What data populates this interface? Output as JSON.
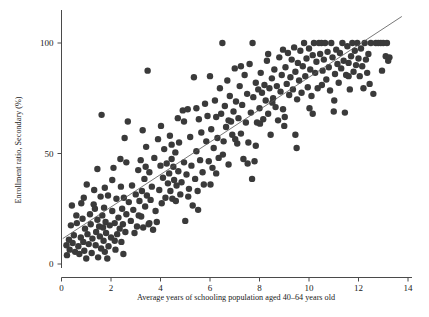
{
  "chart_data": {
    "type": "scatter",
    "title": "",
    "xlabel": "Average years of schooling population aged 40–64 years old",
    "ylabel": "Enrollment ratio, Secondary (%)",
    "xlim": [
      -0.4,
      14.6
    ],
    "ylim": [
      -6,
      116
    ],
    "xticks": [
      0,
      2,
      4,
      6,
      8,
      10,
      12,
      14
    ],
    "xticklabels": [
      "0",
      "2",
      "4",
      "6",
      "8",
      "10",
      "12",
      "14"
    ],
    "yticks": [
      0,
      50,
      100
    ],
    "yticklabels": [
      "0",
      "50",
      "100"
    ],
    "grid": false,
    "legend": null,
    "marker": {
      "shape": "circle",
      "size": 3.2,
      "color": "#3a3a3a"
    },
    "fit_line": {
      "type": "linear",
      "color": "#555555",
      "x_start": 0.05,
      "x_end": 13.75,
      "y_start": 11.5,
      "y_end": 112.0,
      "slope": 7.34,
      "intercept": 11.13
    },
    "points": [
      [
        0.2,
        8.5
      ],
      [
        0.22,
        4.0
      ],
      [
        0.3,
        11.0
      ],
      [
        0.33,
        6.5
      ],
      [
        0.38,
        17.5
      ],
      [
        0.42,
        26.5
      ],
      [
        0.45,
        9.5
      ],
      [
        0.5,
        13.0
      ],
      [
        0.55,
        5.5
      ],
      [
        0.6,
        22.0
      ],
      [
        0.62,
        18.5
      ],
      [
        0.68,
        8.0
      ],
      [
        0.72,
        4.5
      ],
      [
        0.78,
        12.0
      ],
      [
        0.8,
        27.5
      ],
      [
        0.85,
        20.5
      ],
      [
        0.88,
        10.0
      ],
      [
        0.92,
        6.0
      ],
      [
        0.95,
        16.0
      ],
      [
        1.0,
        2.5
      ],
      [
        1.02,
        36.0
      ],
      [
        1.05,
        13.5
      ],
      [
        1.1,
        9.0
      ],
      [
        1.15,
        22.5
      ],
      [
        1.18,
        18.0
      ],
      [
        1.22,
        5.0
      ],
      [
        1.25,
        11.5
      ],
      [
        1.3,
        27.0
      ],
      [
        1.32,
        33.5
      ],
      [
        1.38,
        8.5
      ],
      [
        1.4,
        14.5
      ],
      [
        1.45,
        20.0
      ],
      [
        1.48,
        3.0
      ],
      [
        1.52,
        17.0
      ],
      [
        1.55,
        12.5
      ],
      [
        1.58,
        30.5
      ],
      [
        1.6,
        7.0
      ],
      [
        1.62,
        67.5
      ],
      [
        1.65,
        22.0
      ],
      [
        1.68,
        16.5
      ],
      [
        1.7,
        10.5
      ],
      [
        1.72,
        25.5
      ],
      [
        1.75,
        5.5
      ],
      [
        1.78,
        19.0
      ],
      [
        1.8,
        14.0
      ],
      [
        1.85,
        2.5
      ],
      [
        1.88,
        31.0
      ],
      [
        1.9,
        8.0
      ],
      [
        1.95,
        17.5
      ],
      [
        2.0,
        12.0
      ],
      [
        2.05,
        24.0
      ],
      [
        2.1,
        43.5
      ],
      [
        2.15,
        18.5
      ],
      [
        2.18,
        6.5
      ],
      [
        2.22,
        29.5
      ],
      [
        2.25,
        13.5
      ],
      [
        2.3,
        21.0
      ],
      [
        2.35,
        16.0
      ],
      [
        2.38,
        47.5
      ],
      [
        2.4,
        35.0
      ],
      [
        2.42,
        10.0
      ],
      [
        2.45,
        25.0
      ],
      [
        2.48,
        18.0
      ],
      [
        2.5,
        4.5
      ],
      [
        2.52,
        30.0
      ],
      [
        2.55,
        57.0
      ],
      [
        2.58,
        14.5
      ],
      [
        2.62,
        22.5
      ],
      [
        2.68,
        64.5
      ],
      [
        2.72,
        28.0
      ],
      [
        2.8,
        19.5
      ],
      [
        2.85,
        35.5
      ],
      [
        2.9,
        24.5
      ],
      [
        3.0,
        31.5
      ],
      [
        3.05,
        17.0
      ],
      [
        3.1,
        42.5
      ],
      [
        3.15,
        28.5
      ],
      [
        3.2,
        47.0
      ],
      [
        3.22,
        21.5
      ],
      [
        3.25,
        33.0
      ],
      [
        3.28,
        60.5
      ],
      [
        3.3,
        16.5
      ],
      [
        3.35,
        38.5
      ],
      [
        3.38,
        26.0
      ],
      [
        3.4,
        44.0
      ],
      [
        3.45,
        31.0
      ],
      [
        3.48,
        87.5
      ],
      [
        3.52,
        18.0
      ],
      [
        3.55,
        41.5
      ],
      [
        3.6,
        29.0
      ],
      [
        3.65,
        35.0
      ],
      [
        3.7,
        15.5
      ],
      [
        3.75,
        48.0
      ],
      [
        3.8,
        24.0
      ],
      [
        3.85,
        19.0
      ],
      [
        3.9,
        56.5
      ],
      [
        3.95,
        33.5
      ],
      [
        4.0,
        44.5
      ],
      [
        4.05,
        27.5
      ],
      [
        4.1,
        39.0
      ],
      [
        4.15,
        52.0
      ],
      [
        4.2,
        30.0
      ],
      [
        4.25,
        45.5
      ],
      [
        4.3,
        36.5
      ],
      [
        4.35,
        41.0
      ],
      [
        4.38,
        58.0
      ],
      [
        4.4,
        33.0
      ],
      [
        4.45,
        47.5
      ],
      [
        4.48,
        29.5
      ],
      [
        4.52,
        44.0
      ],
      [
        4.55,
        38.0
      ],
      [
        4.6,
        50.5
      ],
      [
        4.65,
        35.5
      ],
      [
        4.7,
        66.0
      ],
      [
        4.72,
        42.0
      ],
      [
        4.75,
        55.0
      ],
      [
        4.8,
        31.5
      ],
      [
        4.85,
        37.0
      ],
      [
        4.9,
        69.5
      ],
      [
        4.95,
        46.0
      ],
      [
        5.0,
        19.5
      ],
      [
        5.05,
        40.5
      ],
      [
        5.1,
        70.0
      ],
      [
        5.15,
        34.0
      ],
      [
        5.2,
        57.5
      ],
      [
        5.25,
        44.5
      ],
      [
        5.3,
        26.5
      ],
      [
        5.35,
        84.5
      ],
      [
        5.4,
        38.5
      ],
      [
        5.45,
        51.0
      ],
      [
        5.5,
        33.0
      ],
      [
        5.55,
        65.5
      ],
      [
        5.6,
        47.0
      ],
      [
        5.65,
        59.5
      ],
      [
        5.7,
        41.5
      ],
      [
        5.75,
        36.0
      ],
      [
        5.8,
        72.5
      ],
      [
        5.85,
        55.5
      ],
      [
        5.9,
        67.0
      ],
      [
        5.95,
        46.5
      ],
      [
        6.0,
        85.0
      ],
      [
        6.05,
        61.0
      ],
      [
        6.1,
        43.5
      ],
      [
        6.15,
        52.5
      ],
      [
        6.2,
        74.0
      ],
      [
        6.25,
        66.5
      ],
      [
        6.3,
        57.0
      ],
      [
        6.35,
        48.0
      ],
      [
        6.4,
        79.5
      ],
      [
        6.45,
        68.0
      ],
      [
        6.5,
        100.0
      ],
      [
        6.55,
        55.5
      ],
      [
        6.6,
        71.5
      ],
      [
        6.65,
        62.0
      ],
      [
        6.7,
        83.0
      ],
      [
        6.75,
        45.0
      ],
      [
        6.8,
        76.0
      ],
      [
        6.85,
        64.5
      ],
      [
        6.9,
        58.5
      ],
      [
        6.95,
        69.0
      ],
      [
        7.0,
        88.5
      ],
      [
        7.05,
        73.5
      ],
      [
        7.1,
        54.5
      ],
      [
        7.15,
        66.0
      ],
      [
        7.2,
        80.5
      ],
      [
        7.25,
        59.0
      ],
      [
        7.3,
        72.0
      ],
      [
        7.35,
        47.5
      ],
      [
        7.4,
        85.5
      ],
      [
        7.45,
        64.0
      ],
      [
        7.5,
        77.0
      ],
      [
        7.55,
        55.0
      ],
      [
        7.6,
        90.5
      ],
      [
        7.65,
        68.5
      ],
      [
        7.7,
        38.5
      ],
      [
        7.72,
        100.0
      ],
      [
        7.75,
        75.5
      ],
      [
        7.8,
        46.5
      ],
      [
        7.85,
        82.0
      ],
      [
        7.9,
        64.0
      ],
      [
        7.95,
        79.0
      ],
      [
        8.0,
        70.5
      ],
      [
        8.05,
        86.5
      ],
      [
        8.1,
        77.5
      ],
      [
        8.15,
        65.5
      ],
      [
        8.2,
        81.0
      ],
      [
        8.25,
        74.0
      ],
      [
        8.3,
        92.0
      ],
      [
        8.35,
        68.0
      ],
      [
        8.4,
        79.5
      ],
      [
        8.45,
        58.5
      ],
      [
        8.5,
        84.0
      ],
      [
        8.55,
        75.0
      ],
      [
        8.6,
        88.0
      ],
      [
        8.65,
        71.0
      ],
      [
        8.7,
        80.5
      ],
      [
        8.75,
        65.0
      ],
      [
        8.8,
        93.5
      ],
      [
        8.85,
        78.0
      ],
      [
        8.9,
        85.5
      ],
      [
        8.95,
        70.0
      ],
      [
        9.0,
        62.5
      ],
      [
        9.05,
        89.0
      ],
      [
        9.1,
        81.5
      ],
      [
        9.15,
        95.5
      ],
      [
        9.2,
        76.5
      ],
      [
        9.25,
        84.5
      ],
      [
        9.3,
        92.5
      ],
      [
        9.35,
        79.0
      ],
      [
        9.4,
        98.0
      ],
      [
        9.45,
        87.0
      ],
      [
        9.5,
        52.5
      ],
      [
        9.55,
        91.0
      ],
      [
        9.6,
        83.0
      ],
      [
        9.65,
        96.5
      ],
      [
        9.7,
        77.5
      ],
      [
        9.75,
        89.5
      ],
      [
        9.8,
        100.0
      ],
      [
        9.85,
        85.0
      ],
      [
        9.9,
        93.0
      ],
      [
        9.95,
        80.0
      ],
      [
        10.0,
        97.5
      ],
      [
        10.05,
        88.0
      ],
      [
        10.1,
        76.0
      ],
      [
        10.15,
        94.5
      ],
      [
        10.2,
        100.0
      ],
      [
        10.25,
        86.5
      ],
      [
        10.3,
        91.5
      ],
      [
        10.35,
        79.5
      ],
      [
        10.4,
        100.0
      ],
      [
        10.45,
        95.0
      ],
      [
        10.5,
        100.0
      ],
      [
        10.55,
        87.5
      ],
      [
        10.6,
        92.5
      ],
      [
        10.65,
        100.0
      ],
      [
        10.7,
        83.5
      ],
      [
        10.75,
        96.0
      ],
      [
        10.8,
        89.0
      ],
      [
        10.85,
        78.5
      ],
      [
        10.9,
        100.0
      ],
      [
        10.95,
        93.5
      ],
      [
        11.0,
        69.0
      ],
      [
        11.05,
        86.0
      ],
      [
        11.1,
        97.0
      ],
      [
        11.15,
        90.5
      ],
      [
        11.2,
        82.0
      ],
      [
        11.25,
        95.5
      ],
      [
        11.3,
        88.5
      ],
      [
        11.35,
        100.0
      ],
      [
        11.4,
        92.0
      ],
      [
        11.45,
        68.5
      ],
      [
        11.5,
        85.5
      ],
      [
        11.55,
        98.5
      ],
      [
        11.6,
        91.0
      ],
      [
        11.65,
        79.0
      ],
      [
        11.7,
        94.0
      ],
      [
        11.75,
        100.0
      ],
      [
        11.8,
        87.0
      ],
      [
        11.85,
        96.5
      ],
      [
        11.9,
        90.0
      ],
      [
        11.95,
        100.0
      ],
      [
        12.0,
        93.0
      ],
      [
        12.05,
        85.0
      ],
      [
        12.1,
        97.5
      ],
      [
        12.15,
        89.5
      ],
      [
        12.2,
        79.5
      ],
      [
        12.25,
        100.0
      ],
      [
        12.3,
        92.5
      ],
      [
        12.35,
        86.5
      ],
      [
        12.4,
        95.0
      ],
      [
        12.5,
        100.0
      ],
      [
        12.6,
        77.0
      ],
      [
        12.7,
        100.0
      ],
      [
        12.8,
        100.0
      ],
      [
        12.9,
        100.0
      ],
      [
        13.0,
        100.0
      ],
      [
        13.1,
        94.0
      ],
      [
        13.15,
        100.0
      ],
      [
        13.2,
        92.0
      ],
      [
        13.25,
        93.5
      ],
      [
        1.45,
        43.0
      ],
      [
        2.05,
        38.0
      ],
      [
        2.62,
        46.0
      ],
      [
        3.12,
        22.0
      ],
      [
        3.42,
        53.0
      ],
      [
        4.02,
        62.5
      ],
      [
        4.62,
        28.5
      ],
      [
        5.12,
        30.5
      ],
      [
        5.52,
        24.5
      ],
      [
        6.02,
        36.0
      ],
      [
        6.52,
        49.5
      ],
      [
        7.02,
        56.5
      ],
      [
        7.52,
        45.5
      ],
      [
        8.02,
        63.5
      ],
      [
        8.52,
        73.0
      ],
      [
        9.02,
        66.5
      ],
      [
        9.52,
        74.5
      ],
      [
        10.02,
        70.5
      ],
      [
        10.52,
        81.0
      ],
      [
        11.02,
        74.0
      ],
      [
        0.9,
        30.0
      ],
      [
        1.35,
        25.0
      ],
      [
        1.75,
        34.5
      ],
      [
        2.15,
        10.5
      ],
      [
        2.95,
        14.0
      ],
      [
        3.55,
        18.5
      ],
      [
        4.45,
        54.0
      ],
      [
        4.95,
        64.5
      ],
      [
        5.45,
        70.5
      ],
      [
        6.25,
        41.0
      ],
      [
        6.75,
        65.0
      ],
      [
        7.25,
        89.5
      ],
      [
        7.85,
        53.5
      ],
      [
        8.35,
        95.0
      ],
      [
        8.95,
        97.0
      ],
      [
        9.45,
        58.5
      ],
      [
        10.15,
        68.0
      ],
      [
        11.6,
        85.0
      ],
      [
        12.45,
        81.5
      ],
      [
        12.95,
        87.5
      ]
    ]
  },
  "axes": {
    "x_tick_count": 8,
    "y_tick_count": 3
  }
}
